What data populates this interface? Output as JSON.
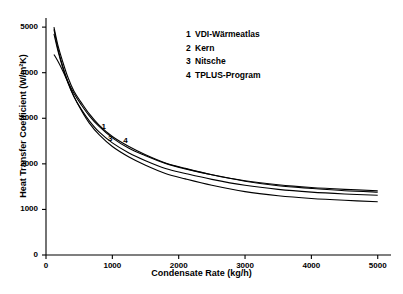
{
  "chart_data": {
    "type": "line",
    "title": "",
    "xlabel": "Condensate Rate (kg/h)",
    "ylabel": "Heat Transfer Coefficient (W/m²K)",
    "xlim": [
      0,
      5200
    ],
    "ylim": [
      0,
      5200
    ],
    "xticks": [
      0,
      1000,
      2000,
      3000,
      4000,
      5000
    ],
    "yticks": [
      0,
      1000,
      2000,
      3000,
      4000,
      5000
    ],
    "grid": false,
    "legend_position": "upper-center",
    "legend": [
      {
        "num": "1",
        "label": "VDI-Wärmeatlas"
      },
      {
        "num": "2",
        "label": "Kern"
      },
      {
        "num": "3",
        "label": "Nitsche"
      },
      {
        "num": "4",
        "label": "TPLUS-Program"
      }
    ],
    "annotations": [
      {
        "text": "1",
        "x": 880,
        "y": 2780
      },
      {
        "text": "3",
        "x": 980,
        "y": 2520
      },
      {
        "text": "4",
        "x": 1210,
        "y": 2480
      }
    ],
    "series": [
      {
        "name": "VDI-Wärmeatlas",
        "num": "1",
        "x": [
          120,
          180,
          250,
          330,
          420,
          530,
          650,
          800,
          1000,
          1250,
          1500,
          1800,
          2100,
          2500,
          3000,
          3500,
          4000,
          4500,
          5000
        ],
        "y": [
          5000,
          4600,
          4250,
          3900,
          3600,
          3350,
          3100,
          2850,
          2600,
          2380,
          2200,
          2020,
          1900,
          1760,
          1620,
          1520,
          1460,
          1410,
          1380
        ]
      },
      {
        "name": "Kern",
        "num": "2",
        "x": [
          120,
          180,
          250,
          330,
          420,
          530,
          650,
          800,
          1000,
          1250,
          1500,
          1800,
          2100,
          2500,
          3000,
          3500,
          4000,
          4500,
          5000
        ],
        "y": [
          4400,
          4250,
          4050,
          3800,
          3550,
          3300,
          3060,
          2820,
          2570,
          2340,
          2180,
          2010,
          1890,
          1760,
          1630,
          1540,
          1480,
          1440,
          1410
        ]
      },
      {
        "name": "Nitsche",
        "num": "3",
        "x": [
          120,
          180,
          250,
          330,
          420,
          530,
          650,
          800,
          1000,
          1250,
          1500,
          1800,
          2100,
          2500,
          3000,
          3500,
          4000,
          4500,
          5000
        ],
        "y": [
          4850,
          4480,
          4120,
          3780,
          3480,
          3200,
          2950,
          2700,
          2460,
          2240,
          2070,
          1900,
          1790,
          1660,
          1530,
          1440,
          1380,
          1340,
          1310
        ]
      },
      {
        "name": "TPLUS-Program",
        "num": "4",
        "x": [
          120,
          180,
          250,
          330,
          420,
          530,
          650,
          800,
          1000,
          1250,
          1500,
          1800,
          2100,
          2500,
          3000,
          3500,
          4000,
          4500,
          5000
        ],
        "y": [
          4950,
          4520,
          4150,
          3800,
          3480,
          3180,
          2900,
          2640,
          2380,
          2150,
          1970,
          1790,
          1670,
          1530,
          1390,
          1300,
          1240,
          1200,
          1170
        ]
      }
    ]
  }
}
